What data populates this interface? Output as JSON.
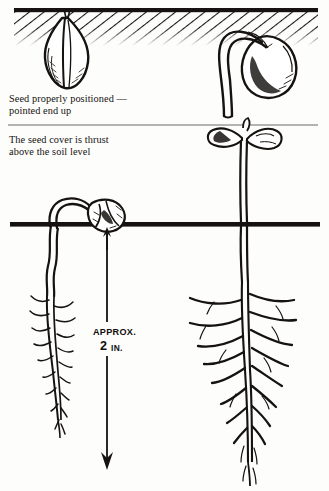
{
  "figure": {
    "ink_color": "#12100e",
    "paper_color": "#fdfdfb",
    "panels": [
      {
        "name": "upper-panel",
        "description": "Two seeds shown below the soil surface: an ungerminated seed pointed end up, and a germinating seed with emerging radicle."
      },
      {
        "name": "lower-panel",
        "description": "Two seedlings: one just pushing its seed cover above the soil line, and a fully established seedling with open cotyledons and branched taproot."
      }
    ]
  },
  "captions": {
    "seed_position": "Seed properly positioned —\npointed end up",
    "seed_cover": "The seed cover is thrust\nabove the soil level"
  },
  "measurement": {
    "name": "planting-depth",
    "approx_label": "APPROX.",
    "value": "2",
    "unit": "IN.",
    "full_text": "APPROX. 2 IN.",
    "arrow_direction": "down"
  },
  "elements": {
    "soil_line_upper": "soil-surface-line-upper",
    "soil_line_lower": "soil-surface-line-lower",
    "divider": "caption-divider-rule",
    "seed_dormant": "dormant-seed",
    "seed_germinating": "germinating-seed",
    "seedling_emerging": "emerging-seedling",
    "seedling_established": "established-seedling"
  }
}
